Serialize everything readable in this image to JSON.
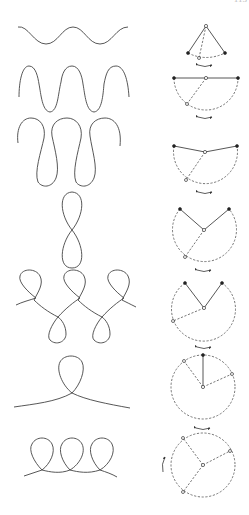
{
  "figure": {
    "corner_text": "113",
    "rows": [
      {
        "id": 1,
        "trajectory": "sinusoidal-wave",
        "pendulum": "small-swing",
        "swing_arrow": "double-headed"
      },
      {
        "id": 2,
        "trajectory": "steep-wave",
        "pendulum": "horizontal-swing-90deg",
        "swing_arrow": "double-headed"
      },
      {
        "id": 3,
        "trajectory": "s-shaped-wave",
        "pendulum": "over-horizontal-swing",
        "swing_arrow": "double-headed"
      },
      {
        "id": 4,
        "trajectory": "figure-eight",
        "pendulum": "large-swing",
        "swing_arrow": "double-headed"
      },
      {
        "id": 5,
        "trajectory": "looped-wave",
        "pendulum": "very-large-swing",
        "swing_arrow": "double-headed"
      },
      {
        "id": 6,
        "trajectory": "single-loop",
        "pendulum": "full-circle-separatrix",
        "swing_arrow": "double-headed"
      },
      {
        "id": 7,
        "trajectory": "continuous-loops",
        "pendulum": "full-rotation",
        "swing_arrow": "curved-single"
      }
    ]
  },
  "colors": {
    "line": "#444444",
    "background": "#ffffff",
    "bob_filled": "#222222"
  }
}
